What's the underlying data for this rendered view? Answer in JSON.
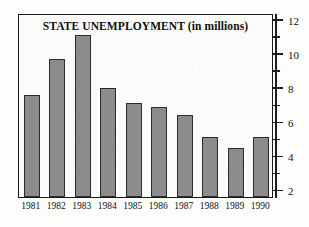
{
  "chart_data": {
    "type": "bar",
    "title": "STATE UNEMPLOYMENT (in millions)",
    "xlabel": "",
    "ylabel": "",
    "categories": [
      "1981",
      "1982",
      "1983",
      "1984",
      "1985",
      "1986",
      "1987",
      "1988",
      "1989",
      "1990"
    ],
    "values": [
      7.6,
      9.7,
      11.1,
      8.0,
      7.1,
      6.9,
      6.4,
      5.1,
      4.5,
      5.1
    ],
    "ylim": [
      1.6,
      12.4
    ],
    "y_major_ticks": [
      2,
      4,
      6,
      8,
      10,
      12
    ],
    "y_major_tick_labels": [
      "2",
      "4",
      "6",
      "8",
      "10",
      "12"
    ],
    "y_minor_ticks": [
      3,
      5,
      7,
      9,
      11
    ],
    "grid": false,
    "legend": null,
    "axis_position": "right",
    "bar_color": "#8c8c8c",
    "bar_edge_color": "#2b2b2b",
    "frame_color": "#1a1a1a"
  }
}
